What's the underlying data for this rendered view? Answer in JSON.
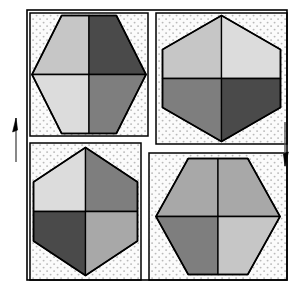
{
  "figure": {
    "canvas": {
      "width": 299,
      "height": 290
    },
    "background_color": "#ffffff",
    "frame": {
      "name": "outer-frame",
      "x": 27,
      "y": 10,
      "width": 260,
      "height": 270,
      "stroke_color": "#000000",
      "stroke_width": 1.6,
      "fill": "none"
    },
    "stipple": {
      "dot_color": "#b9b9b9",
      "field_color": "#fbfbfb",
      "spacing": 7,
      "dot_radius": 0.95
    },
    "palette": {
      "light": "#dcdcdc",
      "medium_light": "#c6c6c6",
      "medium": "#a8a8a8",
      "medium_dark": "#7e7e7e",
      "dark": "#4a4a4a",
      "outline": "#000000",
      "white_gap": "#ffffff"
    },
    "panels": [
      {
        "id": "panel-top-left",
        "label": "Top-left cell",
        "x": 30,
        "y": 13,
        "width": 118,
        "height": 123,
        "hexagon": {
          "orientation": "pointy-horizontal",
          "center_x": 89,
          "center_y": 74.5,
          "radius_x": 57,
          "radius_y": 59,
          "quadrants": {
            "top_left": "#c6c6c6",
            "top_right": "#4a4a4a",
            "bottom_left": "#dcdcdc",
            "bottom_right": "#7e7e7e"
          }
        }
      },
      {
        "id": "panel-top-right",
        "label": "Top-right cell",
        "x": 156,
        "y": 13,
        "width": 131,
        "height": 131,
        "hexagon": {
          "orientation": "pointy-vertical",
          "center_x": 221.5,
          "center_y": 78.5,
          "radius_x": 59,
          "radius_y": 63,
          "quadrants": {
            "top_left": "#c6c6c6",
            "top_right": "#dcdcdc",
            "bottom_left": "#7e7e7e",
            "bottom_right": "#4a4a4a"
          }
        }
      },
      {
        "id": "panel-bottom-left",
        "label": "Bottom-left cell",
        "x": 30,
        "y": 143,
        "width": 111,
        "height": 137,
        "hexagon": {
          "orientation": "pointy-vertical",
          "center_x": 85.5,
          "center_y": 211.5,
          "radius_x": 52,
          "radius_y": 64,
          "quadrants": {
            "top_left": "#dcdcdc",
            "top_right": "#7e7e7e",
            "bottom_left": "#4a4a4a",
            "bottom_right": "#a8a8a8"
          }
        }
      },
      {
        "id": "panel-bottom-right",
        "label": "Bottom-right cell",
        "x": 149,
        "y": 153,
        "width": 138,
        "height": 127,
        "hexagon": {
          "orientation": "pointy-horizontal",
          "center_x": 218,
          "center_y": 216.5,
          "radius_x": 62,
          "radius_y": 58,
          "quadrants": {
            "top_left": "#a8a8a8",
            "top_right": "#a8a8a8",
            "bottom_left": "#7e7e7e",
            "bottom_right": "#c6c6c6"
          }
        }
      }
    ],
    "arrows": [
      {
        "id": "shear-arrow-left",
        "name": "shear-arrow-up-left",
        "direction": "up",
        "x": 16,
        "y_top": 118,
        "y_bottom": 162,
        "stroke_color": "#555555",
        "head_color": "#000000"
      },
      {
        "id": "shear-arrow-right",
        "name": "shear-arrow-down-right",
        "direction": "down",
        "x": 285,
        "y_top": 122,
        "y_bottom": 166,
        "stroke_color": "#555555",
        "head_color": "#000000"
      }
    ]
  }
}
